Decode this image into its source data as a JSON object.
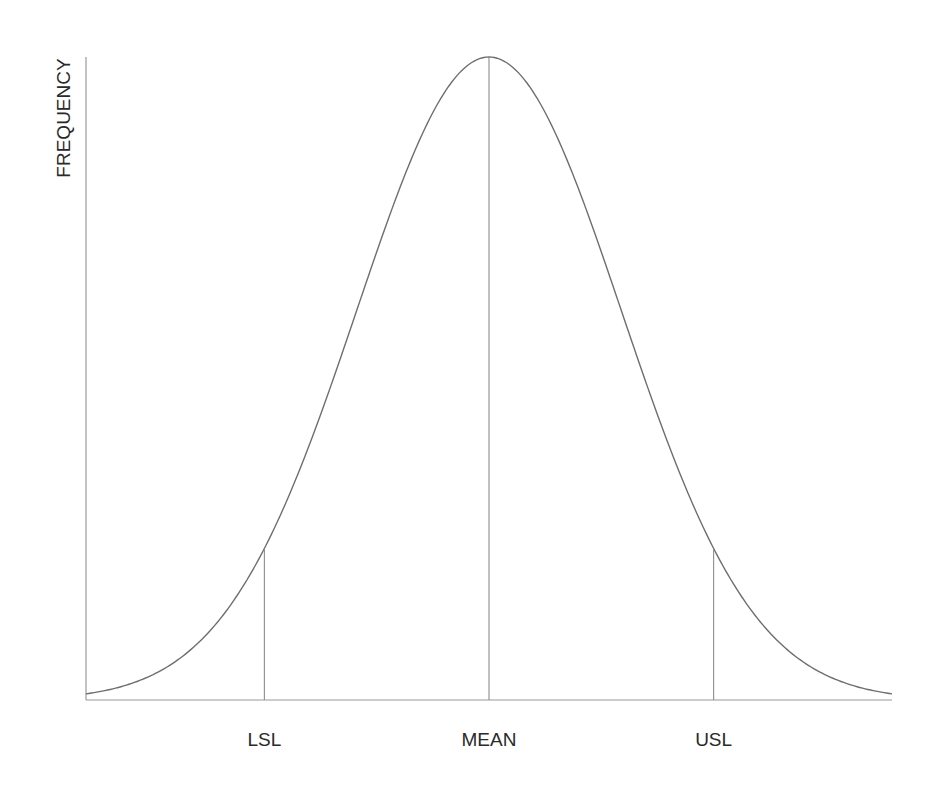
{
  "chart_data": {
    "type": "line",
    "title": "",
    "xlabel": "",
    "ylabel": "FREQUENCY",
    "distribution": "normal",
    "mean": 0,
    "std_dev": 1,
    "xlim": [
      -3.05,
      3.05
    ],
    "ylim": [
      0,
      1
    ],
    "grid": false,
    "legend": "none",
    "series": [
      {
        "name": "normal-distribution-curve",
        "x": [
          -3.0,
          -2.5,
          -2.0,
          -1.7,
          -1.5,
          -1.0,
          -0.5,
          0.0,
          0.5,
          1.0,
          1.5,
          1.7,
          2.0,
          2.5,
          3.0
        ],
        "y": [
          0.011,
          0.044,
          0.135,
          0.236,
          0.325,
          0.607,
          0.882,
          1.0,
          0.882,
          0.607,
          0.325,
          0.236,
          0.135,
          0.044,
          0.011
        ]
      }
    ],
    "markers": [
      {
        "name": "LSL",
        "label": "LSL",
        "x": -1.7
      },
      {
        "name": "MEAN",
        "label": "MEAN",
        "x": 0.0
      },
      {
        "name": "USL",
        "label": "USL",
        "x": 1.7
      }
    ],
    "colors": {
      "curve": "#6e6e6e",
      "axis": "#9a9a9a",
      "marker": "#8c8c8c",
      "text": "#2a2a2a"
    }
  }
}
